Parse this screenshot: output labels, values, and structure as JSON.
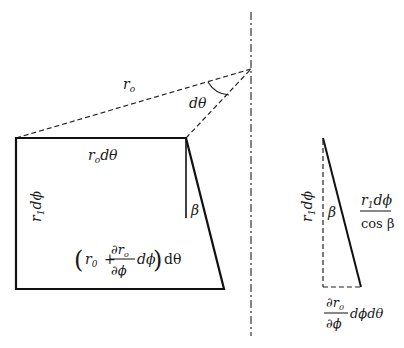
{
  "diagram": {
    "labels": {
      "r_o": "r",
      "r_o_sub": "o",
      "dtheta": "dθ",
      "ro_dtheta_r": "r",
      "ro_dtheta_sub": "o",
      "ro_dtheta_rest": "dθ",
      "r1dphi_left_r": "r",
      "r1dphi_left_sub": "1",
      "r1dphi_left_rest": "dϕ",
      "beta_left": "β",
      "bottom_open": "(",
      "bottom_r": "r",
      "bottom_r_sub": "0",
      "bottom_plus": "+",
      "bottom_num": "∂r",
      "bottom_num_sub": "o",
      "bottom_den": "∂ϕ",
      "bottom_dphi": "dϕ",
      "bottom_close": ")",
      "bottom_dtheta": "dθ",
      "r1dphi_right_r": "r",
      "r1dphi_right_sub": "1",
      "r1dphi_right_rest": "dϕ",
      "beta_right": "β",
      "frac_num_r": "r",
      "frac_num_sub": "1",
      "frac_num_rest": "dϕ",
      "frac_den": "cos β",
      "dr_num": "∂r",
      "dr_num_sub": "0",
      "dr_den": "∂ϕ",
      "dr_rest": "dϕdθ"
    },
    "colors": {
      "stroke": "#1a1a1a",
      "background": "#ffffff"
    }
  }
}
